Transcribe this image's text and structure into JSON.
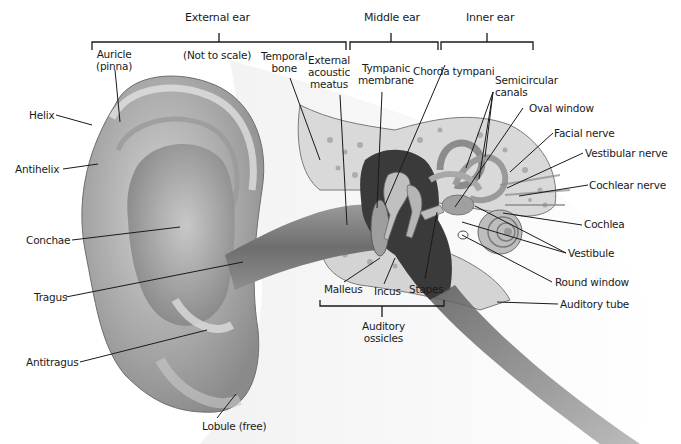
{
  "diagram": {
    "note": "(Not to scale)",
    "regions": [
      {
        "label": "External ear"
      },
      {
        "label": "Middle ear"
      },
      {
        "label": "Inner ear"
      }
    ],
    "group_labels": {
      "auditory_ossicles": [
        "Auditory",
        "ossicles"
      ]
    },
    "labels": {
      "auricle": [
        "Auricle",
        "(pinna)"
      ],
      "temporal_bone": [
        "Temporal",
        "bone"
      ],
      "external_acoustic_meatus": [
        "External",
        "acoustic",
        "meatus"
      ],
      "tympanic_membrane": [
        "Tympanic",
        "membrane"
      ],
      "chorda_tympani": "Chorda tympani",
      "semicircular_canals": [
        "Semicircular",
        "canals"
      ],
      "oval_window": "Oval window",
      "facial_nerve": "Facial nerve",
      "vestibular_nerve": "Vestibular nerve",
      "cochlear_nerve": "Cochlear nerve",
      "cochlea": "Cochlea",
      "vestibule": "Vestibule",
      "round_window": "Round window",
      "auditory_tube": "Auditory tube",
      "helix": "Helix",
      "antihelix": "Antihelix",
      "conchae": "Conchae",
      "tragus": "Tragus",
      "antitragus": "Antitragus",
      "lobule": "Lobule (free)",
      "malleus": "Malleus",
      "incus": "Incus",
      "stapes": "Stapes"
    },
    "colors": {
      "ink": "#1a1a1a",
      "skin_light": "#e6e6e6",
      "skin_mid": "#b8b8b8",
      "skin_dark": "#7a7a7a",
      "cavity": "#3a3a3a",
      "bone": "#d9d9d9"
    }
  }
}
